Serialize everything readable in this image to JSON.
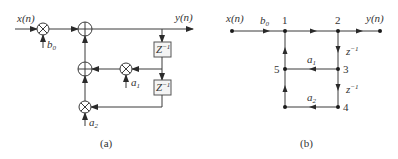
{
  "diagram_a": {
    "caption": "(a)",
    "input_label": "x(n)",
    "output_label": "y(n)",
    "coef_b0": {
      "base": "b",
      "sub": "0"
    },
    "coef_a1": {
      "base": "a",
      "sub": "1"
    },
    "coef_a2": {
      "base": "a",
      "sub": "2"
    },
    "delay1": {
      "base": "Z",
      "sup": "−1"
    },
    "delay2": {
      "base": "Z",
      "sup": "−1"
    },
    "blocks": [
      "multiplier-b0",
      "adder-top",
      "adder-middle",
      "multiplier-a1",
      "multiplier-a2",
      "delay-1",
      "delay-2"
    ]
  },
  "diagram_b": {
    "caption": "(b)",
    "input_label": "x(n)",
    "output_label": "y(n)",
    "branch_b0": {
      "base": "b",
      "sub": "0"
    },
    "branch_a1": {
      "base": "a",
      "sub": "1"
    },
    "branch_a2": {
      "base": "a",
      "sub": "2"
    },
    "branch_z1": {
      "base": "z",
      "sup": "−1"
    },
    "branch_z2": {
      "base": "z",
      "sup": "−1"
    },
    "nodes": {
      "n1": "1",
      "n2": "2",
      "n3": "3",
      "n4": "4",
      "n5": "5"
    }
  }
}
